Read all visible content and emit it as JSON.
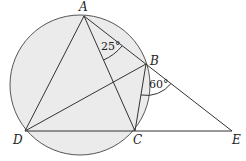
{
  "diagram": {
    "type": "circle-geometry",
    "points": {
      "A": {
        "label": "A",
        "x": 84,
        "y": 16
      },
      "B": {
        "label": "B",
        "x": 146,
        "y": 64
      },
      "C": {
        "label": "C",
        "x": 135,
        "y": 131
      },
      "D": {
        "label": "D",
        "x": 25,
        "y": 131
      },
      "E": {
        "label": "E",
        "x": 232,
        "y": 131
      }
    },
    "circle": {
      "cx": 80,
      "cy": 85,
      "r": 70
    },
    "segments": [
      "AD",
      "AC",
      "AE",
      "DB",
      "BC",
      "DE"
    ],
    "angles": [
      {
        "label": "25°",
        "at": "A",
        "between": [
          "AC",
          "AB"
        ]
      },
      {
        "label": "60°",
        "at": "B",
        "between": [
          "BC",
          "BE"
        ]
      }
    ],
    "colors": {
      "fill": "#ebebeb",
      "stroke": "#333333",
      "background": "#ffffff"
    }
  }
}
